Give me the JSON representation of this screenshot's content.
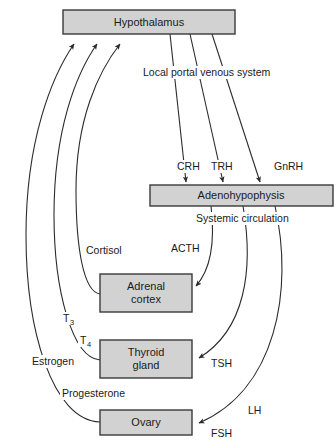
{
  "diagram": {
    "colors": {
      "box_fill": "#d2d2d2",
      "box_stroke": "#3a3a3a",
      "line": "#2b2b2b",
      "text": "#1a1a1a",
      "background": "#ffffff"
    },
    "nodes": [
      {
        "id": "hypothalamus",
        "label": "Hypothalamus",
        "label2": "",
        "x": 63,
        "y": 10,
        "w": 172,
        "h": 24
      },
      {
        "id": "adenohypophysis",
        "label": "Adenohypophysis",
        "label2": "",
        "x": 150,
        "y": 185,
        "w": 183,
        "h": 21
      },
      {
        "id": "adrenal-cortex",
        "label": "Adrenal",
        "label2": "cortex",
        "x": 100,
        "y": 274,
        "w": 92,
        "h": 38
      },
      {
        "id": "thyroid-gland",
        "label": "Thyroid",
        "label2": "gland",
        "x": 100,
        "y": 340,
        "w": 92,
        "h": 38
      },
      {
        "id": "ovary",
        "label": "Ovary",
        "label2": "",
        "x": 100,
        "y": 410,
        "w": 92,
        "h": 25
      }
    ],
    "pathway_labels": [
      {
        "id": "local-portal-venous-system",
        "text": "Local portal venous system",
        "x": 143,
        "y": 76
      },
      {
        "id": "systemic-circulation",
        "text": "Systemic circulation",
        "x": 196,
        "y": 222
      }
    ],
    "releasing_hormones": [
      {
        "id": "crh",
        "text": "CRH",
        "x": 177,
        "y": 170
      },
      {
        "id": "trh",
        "text": "TRH",
        "x": 211,
        "y": 170
      },
      {
        "id": "gnrh",
        "text": "GnRH",
        "x": 274,
        "y": 170
      }
    ],
    "tropic_hormones": [
      {
        "id": "acth",
        "text": "ACTH",
        "x": 171,
        "y": 252
      },
      {
        "id": "tsh",
        "text": "TSH",
        "x": 211,
        "y": 367
      },
      {
        "id": "lh",
        "text": "LH",
        "x": 248,
        "y": 414
      },
      {
        "id": "fsh",
        "text": "FSH",
        "x": 211,
        "y": 437
      }
    ],
    "feedback_hormones": [
      {
        "id": "cortisol",
        "text": "Cortisol",
        "x": 86,
        "y": 254
      },
      {
        "id": "t3",
        "text": "T",
        "sub": "3",
        "x": 63,
        "y": 322
      },
      {
        "id": "t4",
        "text": "T",
        "sub": "4",
        "x": 80,
        "y": 344
      },
      {
        "id": "estrogen",
        "text": "Estrogen",
        "x": 32,
        "y": 365
      },
      {
        "id": "progesterone",
        "text": "Progesterone",
        "x": 62,
        "y": 397
      }
    ]
  }
}
